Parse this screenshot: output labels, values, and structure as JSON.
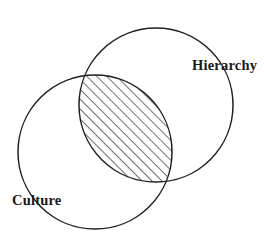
{
  "figure": {
    "type": "venn-diagram",
    "background_color": "#ffffff",
    "stroke_color": "#231f20",
    "text_color": "#1a1a1a",
    "hatch_color": "#2b2b2b",
    "sets": [
      {
        "id": "hierarchy",
        "label": "Hierarchy",
        "label_x": 192,
        "label_y": 70,
        "center_x": 156,
        "center_y": 105,
        "radius": 77
      },
      {
        "id": "culture",
        "label": "Culture",
        "label_x": 12,
        "label_y": 205,
        "center_x": 95,
        "center_y": 152,
        "radius": 77
      }
    ],
    "intersection": {
      "id": "hierarchy-culture-overlap",
      "fill_pattern": "diagonal-hatch",
      "hatch_angle_degrees": 45,
      "hatch_spacing_px": 7,
      "label": ""
    }
  }
}
